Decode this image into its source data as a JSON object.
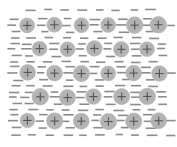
{
  "figure": {
    "width": 177,
    "height": 147,
    "background_color": "#ffffff"
  },
  "style": {
    "ion_fill_color": "#b3b3b3",
    "ion_stroke_color": "#b3b3b3",
    "ion_radius": 7.8,
    "cross_color": "#555555",
    "cross_arm": 4.2,
    "cross_width": 1.1,
    "dash_color": "#8c8c8c",
    "dash_width": 1.6,
    "dash_length": 9
  },
  "chart_data": {
    "type": "scatter",
    "xlabel": "",
    "ylabel": "",
    "xlim": [
      0,
      177
    ],
    "ylim": [
      0,
      147
    ],
    "grid": false,
    "legend": null,
    "annotations": [],
    "series": [
      {
        "name": "positive-ions",
        "marker": "circle-with-plus",
        "marker_label": "+",
        "points": [
          {
            "x": 27,
            "y": 25
          },
          {
            "x": 54,
            "y": 25
          },
          {
            "x": 81,
            "y": 25
          },
          {
            "x": 108,
            "y": 25
          },
          {
            "x": 134,
            "y": 25
          },
          {
            "x": 159,
            "y": 25
          },
          {
            "x": 40,
            "y": 49
          },
          {
            "x": 67,
            "y": 49
          },
          {
            "x": 94,
            "y": 49
          },
          {
            "x": 121,
            "y": 49
          },
          {
            "x": 147,
            "y": 49
          },
          {
            "x": 27,
            "y": 73
          },
          {
            "x": 54,
            "y": 73
          },
          {
            "x": 81,
            "y": 73
          },
          {
            "x": 108,
            "y": 73
          },
          {
            "x": 134,
            "y": 73
          },
          {
            "x": 159,
            "y": 73
          },
          {
            "x": 40,
            "y": 97
          },
          {
            "x": 67,
            "y": 97
          },
          {
            "x": 94,
            "y": 97
          },
          {
            "x": 121,
            "y": 97
          },
          {
            "x": 147,
            "y": 97
          },
          {
            "x": 27,
            "y": 121
          },
          {
            "x": 54,
            "y": 121
          },
          {
            "x": 81,
            "y": 121
          },
          {
            "x": 108,
            "y": 121
          },
          {
            "x": 134,
            "y": 121
          },
          {
            "x": 159,
            "y": 121
          }
        ]
      },
      {
        "name": "electron-dashes",
        "marker": "horizontal-dash",
        "points": [
          {
            "x": 30,
            "y": 10
          },
          {
            "x": 47,
            "y": 10
          },
          {
            "x": 64,
            "y": 10
          },
          {
            "x": 82,
            "y": 10
          },
          {
            "x": 99,
            "y": 10
          },
          {
            "x": 117,
            "y": 10
          },
          {
            "x": 134,
            "y": 10
          },
          {
            "x": 151,
            "y": 10
          },
          {
            "x": 15,
            "y": 19
          },
          {
            "x": 42,
            "y": 19
          },
          {
            "x": 69,
            "y": 19
          },
          {
            "x": 96,
            "y": 19
          },
          {
            "x": 122,
            "y": 19
          },
          {
            "x": 147,
            "y": 19
          },
          {
            "x": 12,
            "y": 25
          },
          {
            "x": 40,
            "y": 25
          },
          {
            "x": 67,
            "y": 25
          },
          {
            "x": 94,
            "y": 25
          },
          {
            "x": 121,
            "y": 25
          },
          {
            "x": 147,
            "y": 25
          },
          {
            "x": 171,
            "y": 25
          },
          {
            "x": 17,
            "y": 32
          },
          {
            "x": 44,
            "y": 32
          },
          {
            "x": 71,
            "y": 32
          },
          {
            "x": 98,
            "y": 32
          },
          {
            "x": 125,
            "y": 32
          },
          {
            "x": 150,
            "y": 32
          },
          {
            "x": 15,
            "y": 38
          },
          {
            "x": 32,
            "y": 38
          },
          {
            "x": 49,
            "y": 38
          },
          {
            "x": 67,
            "y": 38
          },
          {
            "x": 84,
            "y": 38
          },
          {
            "x": 101,
            "y": 38
          },
          {
            "x": 119,
            "y": 38
          },
          {
            "x": 136,
            "y": 38
          },
          {
            "x": 153,
            "y": 38
          },
          {
            "x": 14,
            "y": 44
          },
          {
            "x": 28,
            "y": 44
          },
          {
            "x": 55,
            "y": 44
          },
          {
            "x": 82,
            "y": 44
          },
          {
            "x": 109,
            "y": 44
          },
          {
            "x": 135,
            "y": 44
          },
          {
            "x": 162,
            "y": 44
          },
          {
            "x": 12,
            "y": 49
          },
          {
            "x": 26,
            "y": 49
          },
          {
            "x": 54,
            "y": 49
          },
          {
            "x": 81,
            "y": 49
          },
          {
            "x": 108,
            "y": 49
          },
          {
            "x": 134,
            "y": 49
          },
          {
            "x": 162,
            "y": 49
          },
          {
            "x": 16,
            "y": 56
          },
          {
            "x": 30,
            "y": 56
          },
          {
            "x": 57,
            "y": 56
          },
          {
            "x": 84,
            "y": 56
          },
          {
            "x": 111,
            "y": 56
          },
          {
            "x": 137,
            "y": 56
          },
          {
            "x": 164,
            "y": 56
          },
          {
            "x": 15,
            "y": 62
          },
          {
            "x": 32,
            "y": 62
          },
          {
            "x": 49,
            "y": 62
          },
          {
            "x": 67,
            "y": 62
          },
          {
            "x": 84,
            "y": 62
          },
          {
            "x": 101,
            "y": 62
          },
          {
            "x": 119,
            "y": 62
          },
          {
            "x": 136,
            "y": 62
          },
          {
            "x": 153,
            "y": 62
          },
          {
            "x": 15,
            "y": 67
          },
          {
            "x": 42,
            "y": 67
          },
          {
            "x": 69,
            "y": 67
          },
          {
            "x": 96,
            "y": 67
          },
          {
            "x": 122,
            "y": 67
          },
          {
            "x": 147,
            "y": 67
          },
          {
            "x": 12,
            "y": 73
          },
          {
            "x": 40,
            "y": 73
          },
          {
            "x": 67,
            "y": 73
          },
          {
            "x": 94,
            "y": 73
          },
          {
            "x": 121,
            "y": 73
          },
          {
            "x": 147,
            "y": 73
          },
          {
            "x": 171,
            "y": 73
          },
          {
            "x": 17,
            "y": 80
          },
          {
            "x": 44,
            "y": 80
          },
          {
            "x": 71,
            "y": 80
          },
          {
            "x": 98,
            "y": 80
          },
          {
            "x": 125,
            "y": 80
          },
          {
            "x": 150,
            "y": 80
          },
          {
            "x": 15,
            "y": 86
          },
          {
            "x": 32,
            "y": 86
          },
          {
            "x": 49,
            "y": 86
          },
          {
            "x": 67,
            "y": 86
          },
          {
            "x": 84,
            "y": 86
          },
          {
            "x": 101,
            "y": 86
          },
          {
            "x": 119,
            "y": 86
          },
          {
            "x": 136,
            "y": 86
          },
          {
            "x": 153,
            "y": 86
          },
          {
            "x": 14,
            "y": 92
          },
          {
            "x": 28,
            "y": 92
          },
          {
            "x": 55,
            "y": 92
          },
          {
            "x": 82,
            "y": 92
          },
          {
            "x": 109,
            "y": 92
          },
          {
            "x": 135,
            "y": 92
          },
          {
            "x": 162,
            "y": 92
          },
          {
            "x": 12,
            "y": 97
          },
          {
            "x": 26,
            "y": 97
          },
          {
            "x": 54,
            "y": 97
          },
          {
            "x": 81,
            "y": 97
          },
          {
            "x": 108,
            "y": 97
          },
          {
            "x": 134,
            "y": 97
          },
          {
            "x": 162,
            "y": 97
          },
          {
            "x": 16,
            "y": 104
          },
          {
            "x": 30,
            "y": 104
          },
          {
            "x": 57,
            "y": 104
          },
          {
            "x": 84,
            "y": 104
          },
          {
            "x": 111,
            "y": 104
          },
          {
            "x": 137,
            "y": 104
          },
          {
            "x": 164,
            "y": 104
          },
          {
            "x": 15,
            "y": 110
          },
          {
            "x": 32,
            "y": 110
          },
          {
            "x": 49,
            "y": 110
          },
          {
            "x": 67,
            "y": 110
          },
          {
            "x": 84,
            "y": 110
          },
          {
            "x": 101,
            "y": 110
          },
          {
            "x": 119,
            "y": 110
          },
          {
            "x": 136,
            "y": 110
          },
          {
            "x": 153,
            "y": 110
          },
          {
            "x": 15,
            "y": 115
          },
          {
            "x": 42,
            "y": 115
          },
          {
            "x": 69,
            "y": 115
          },
          {
            "x": 96,
            "y": 115
          },
          {
            "x": 122,
            "y": 115
          },
          {
            "x": 147,
            "y": 115
          },
          {
            "x": 12,
            "y": 121
          },
          {
            "x": 40,
            "y": 121
          },
          {
            "x": 67,
            "y": 121
          },
          {
            "x": 94,
            "y": 121
          },
          {
            "x": 121,
            "y": 121
          },
          {
            "x": 147,
            "y": 121
          },
          {
            "x": 171,
            "y": 121
          },
          {
            "x": 17,
            "y": 128
          },
          {
            "x": 44,
            "y": 128
          },
          {
            "x": 71,
            "y": 128
          },
          {
            "x": 98,
            "y": 128
          },
          {
            "x": 125,
            "y": 128
          },
          {
            "x": 150,
            "y": 128
          },
          {
            "x": 15,
            "y": 135
          },
          {
            "x": 32,
            "y": 135
          },
          {
            "x": 49,
            "y": 135
          },
          {
            "x": 67,
            "y": 135
          },
          {
            "x": 84,
            "y": 135
          },
          {
            "x": 101,
            "y": 135
          },
          {
            "x": 119,
            "y": 135
          },
          {
            "x": 136,
            "y": 135
          },
          {
            "x": 153,
            "y": 135
          },
          {
            "x": 170,
            "y": 135
          }
        ]
      }
    ]
  }
}
